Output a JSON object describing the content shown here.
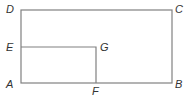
{
  "diagram": {
    "type": "geometry",
    "colors": {
      "line": "#808080",
      "label": "#333333"
    },
    "points": {
      "A": {
        "label": "A",
        "x": 21,
        "y": 83
      },
      "B": {
        "label": "B",
        "x": 172,
        "y": 83
      },
      "C": {
        "label": "C",
        "x": 172,
        "y": 10
      },
      "D": {
        "label": "D",
        "x": 21,
        "y": 10
      },
      "E": {
        "label": "E",
        "x": 21,
        "y": 47
      },
      "F": {
        "label": "F",
        "x": 96,
        "y": 83
      },
      "G": {
        "label": "G",
        "x": 96,
        "y": 47
      }
    },
    "shapes": [
      {
        "name": "rectangle ABCD",
        "vertices": [
          "A",
          "B",
          "C",
          "D"
        ]
      },
      {
        "name": "rectangle AFGE",
        "vertices": [
          "A",
          "F",
          "G",
          "E"
        ]
      }
    ]
  }
}
